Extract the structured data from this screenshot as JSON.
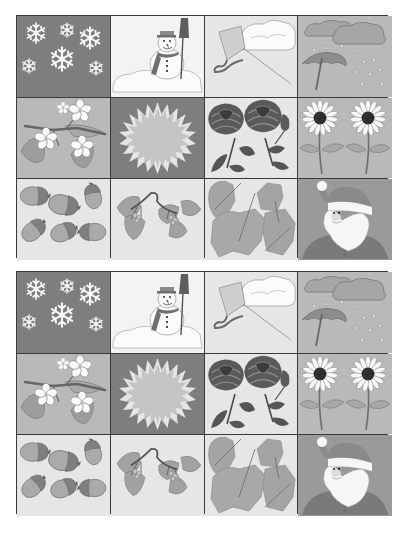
{
  "sheet": {
    "grids": [
      {
        "id": "grid-1",
        "cells": [
          {
            "subject": "snowflakes",
            "season": "winter",
            "background": "#7e7e7e"
          },
          {
            "subject": "snowman",
            "season": "winter",
            "background": "#f3f3f3"
          },
          {
            "subject": "kite-and-cloud",
            "season": "autumn-wind",
            "background": "#e6e6e6"
          },
          {
            "subject": "umbrella-rain-clouds",
            "season": "autumn-rain",
            "background": "#b9b9b9"
          },
          {
            "subject": "blossom-branch",
            "season": "spring",
            "background": "#b9b9b9"
          },
          {
            "subject": "sun",
            "season": "summer",
            "background": "#7e7e7e"
          },
          {
            "subject": "roses",
            "season": "summer",
            "background": "#e6e6e6"
          },
          {
            "subject": "sunflowers",
            "season": "summer",
            "background": "#b9b9b9"
          },
          {
            "subject": "acorns",
            "season": "autumn",
            "background": "#e6e6e6"
          },
          {
            "subject": "berry-branch",
            "season": "autumn",
            "background": "#e6e6e6"
          },
          {
            "subject": "fallen-leaves",
            "season": "autumn",
            "background": "#e6e6e6"
          },
          {
            "subject": "santa-claus",
            "season": "winter",
            "background": "#9a9a9a"
          }
        ]
      },
      {
        "id": "grid-2",
        "cells": [
          {
            "subject": "snowflakes",
            "season": "winter",
            "background": "#7e7e7e"
          },
          {
            "subject": "snowman",
            "season": "winter",
            "background": "#f3f3f3"
          },
          {
            "subject": "kite-and-cloud",
            "season": "autumn-wind",
            "background": "#e6e6e6"
          },
          {
            "subject": "umbrella-rain-clouds",
            "season": "autumn-rain",
            "background": "#b9b9b9"
          },
          {
            "subject": "blossom-branch",
            "season": "spring",
            "background": "#b9b9b9"
          },
          {
            "subject": "sun",
            "season": "summer",
            "background": "#7e7e7e"
          },
          {
            "subject": "roses",
            "season": "summer",
            "background": "#e6e6e6"
          },
          {
            "subject": "sunflowers",
            "season": "summer",
            "background": "#b9b9b9"
          },
          {
            "subject": "acorns",
            "season": "autumn",
            "background": "#e6e6e6"
          },
          {
            "subject": "berry-branch",
            "season": "autumn",
            "background": "#e6e6e6"
          },
          {
            "subject": "fallen-leaves",
            "season": "autumn",
            "background": "#e6e6e6"
          },
          {
            "subject": "santa-claus",
            "season": "winter",
            "background": "#9a9a9a"
          }
        ]
      }
    ],
    "colors": {
      "border": "#3a3a3a",
      "dark": "#7e7e7e",
      "mid": "#b9b9b9",
      "light": "#e6e6e6",
      "white": "#f3f3f3"
    }
  }
}
